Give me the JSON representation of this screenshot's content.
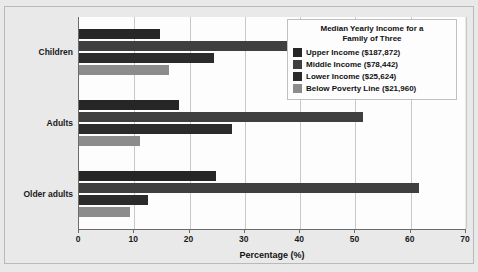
{
  "chart_data": {
    "type": "bar",
    "orientation": "horizontal",
    "title": "",
    "xlabel": "Percentage (%)",
    "ylabel": "",
    "xlim": [
      0,
      70
    ],
    "xticks": [
      0,
      10,
      20,
      30,
      40,
      50,
      60,
      70
    ],
    "grid": "vertical",
    "legend_position": "top-right",
    "legend_title": "Median Yearly Income for a Family of Three",
    "legend_title_line1": "Median Yearly Income for a",
    "legend_title_line2": "Family of Three",
    "categories": [
      "Children",
      "Adults",
      "Older adults"
    ],
    "series": [
      {
        "name": "Upper Income ($187,872)",
        "color": "#262626",
        "values": [
          14.7,
          18.0,
          24.7
        ]
      },
      {
        "name": "Middle Income ($78,442)",
        "color": "#3f3f3f",
        "values": [
          39.0,
          51.4,
          61.5
        ]
      },
      {
        "name": "Lower Income ($25,624)",
        "color": "#2b2b2b",
        "values": [
          24.5,
          27.6,
          12.5
        ]
      },
      {
        "name": "Below Poverty Line ($21,960)",
        "color": "#8c8c8c",
        "values": [
          16.3,
          11.1,
          9.2
        ]
      }
    ]
  },
  "axis": {
    "xlabel": "Percentage (%)",
    "xticklabels": [
      "0",
      "10",
      "20",
      "30",
      "40",
      "50",
      "60",
      "70"
    ],
    "yticklabels": [
      "Children",
      "Adults",
      "Older adults"
    ]
  },
  "legend": {
    "title_line1": "Median Yearly Income for a",
    "title_line2": "Family of Three",
    "items": [
      {
        "label": "Upper Income ($187,872)",
        "color": "#262626"
      },
      {
        "label": "Middle Income ($78,442)",
        "color": "#3f3f3f"
      },
      {
        "label": "Lower Income ($25,624)",
        "color": "#2b2b2b"
      },
      {
        "label": "Below Poverty Line ($21,960)",
        "color": "#8c8c8c"
      }
    ]
  },
  "colors": {
    "figure_background": "#e9e9e9",
    "plot_background": "#fdfdfd",
    "axis": "#6b6b6b",
    "gridline": "#c8c8c8",
    "text": "#111111"
  }
}
